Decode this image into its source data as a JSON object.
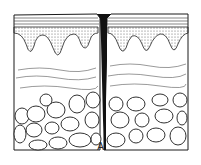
{
  "figure": {
    "label": "A",
    "layers": [
      "epidermis-surface",
      "papillary-layer",
      "dermis",
      "subcutaneous-fat"
    ],
    "colors": {
      "ink": "#1a1a1a",
      "background": "#ffffff"
    }
  }
}
